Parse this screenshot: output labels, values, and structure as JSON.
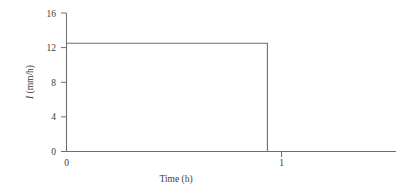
{
  "figure": {
    "background_color": "#ffffff",
    "line_color": "#6e6e6e",
    "text_color": "#3d3d3d"
  },
  "axes": {
    "y_label": "I (mm/h)",
    "y_label_italic_part": "I",
    "y_label_rest": " (mm/h)",
    "x_label": "Time (h)",
    "y_ticks": [
      "16",
      "12",
      "8",
      "4",
      "0"
    ],
    "x_ticks": [
      "0",
      "1"
    ],
    "y_origin_label": "0",
    "x_origin_label": "0"
  },
  "chart_data": {
    "type": "line",
    "title": "",
    "subtitle": "",
    "xlabel": "Time (h)",
    "ylabel": "I (mm/h)",
    "xlim": [
      0,
      1.64
    ],
    "ylim": [
      0,
      16
    ],
    "xticks": [
      0,
      1
    ],
    "xticklabels": [
      "0",
      "1"
    ],
    "yticks": [
      0,
      4,
      8,
      12,
      16
    ],
    "yticklabels": [
      "0",
      "4",
      "8",
      "12",
      "16"
    ],
    "grid": false,
    "legend": false,
    "legend_position": "none",
    "annotations": [],
    "series": [
      {
        "name": "Rainfall intensity",
        "color": "#6e6e6e",
        "x": [
          0,
          0,
          1,
          1
        ],
        "y": [
          0,
          12.5,
          12.5,
          0
        ],
        "plateau_value": 12.5,
        "duration_h": 1,
        "total_depth_mm": 12.5
      }
    ]
  }
}
